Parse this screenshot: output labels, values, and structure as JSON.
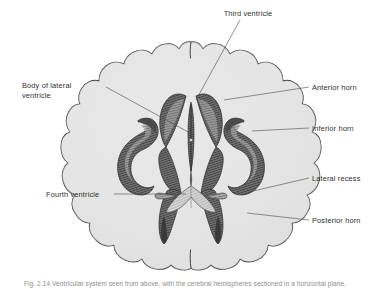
{
  "figure": {
    "caption": "Fig. 2.14 Ventricular system seen from above, with the cerebral hemispheres sectioned in a horizontal plane.",
    "background_color": "#ffffff",
    "brain_fill_color": "#e6e6e6",
    "brain_outline_color": "#3b3b3b",
    "ventricle_dark_color": "#4d4d4d",
    "ventricle_mid_color": "#8a8a8a",
    "ventricle_light_color": "#d8d8d8",
    "label_color": "#2f2f2f",
    "leader_color": "#4a4a4a"
  },
  "labels": [
    {
      "id": "third-ventricle",
      "lines": [
        "Third ventricle"
      ],
      "anchor": "middle",
      "text_x": 248,
      "text_y": 16,
      "side": "top",
      "leader": "M 240 20 L 196 100"
    },
    {
      "id": "body-of-lateral-ventricle",
      "lines": [
        "Body of lateral",
        "ventricle"
      ],
      "anchor": "start",
      "text_x": 22,
      "text_y": 88,
      "side": "left",
      "leader": "M 106 87 L 190 133"
    },
    {
      "id": "anterior-horn",
      "lines": [
        "Anterior horn"
      ],
      "anchor": "start",
      "text_x": 312,
      "text_y": 90,
      "side": "right",
      "leader": "M 309 87 L 224 100"
    },
    {
      "id": "inferior-horn",
      "lines": [
        "Inferior horn"
      ],
      "anchor": "start",
      "text_x": 312,
      "text_y": 131,
      "side": "right",
      "leader": "M 309 128 L 252 131"
    },
    {
      "id": "lateral-recess",
      "lines": [
        "Lateral recess"
      ],
      "anchor": "start",
      "text_x": 312,
      "text_y": 181,
      "side": "right",
      "leader": "M 309 178 L 249 192"
    },
    {
      "id": "posterior-horn",
      "lines": [
        "Posterior horn"
      ],
      "anchor": "start",
      "text_x": 312,
      "text_y": 223,
      "side": "right",
      "leader": "M 309 220 L 247 213"
    },
    {
      "id": "fourth-ventricle",
      "lines": [
        "Fourth ventricle"
      ],
      "anchor": "start",
      "text_x": 46,
      "text_y": 197,
      "side": "left",
      "leader": "M 114 194 L 186 194"
    }
  ]
}
